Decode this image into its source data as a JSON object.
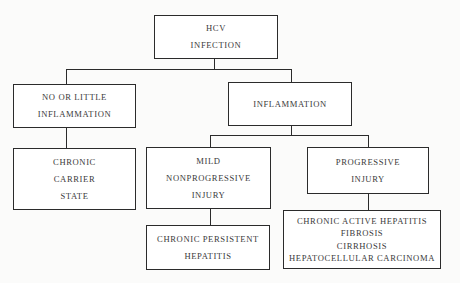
{
  "diagram": {
    "type": "tree",
    "root": {
      "id": "hcv-infection",
      "lines": [
        "HCV",
        "INFECTION"
      ]
    },
    "nodes": {
      "no_little_inflammation": {
        "lines": [
          "NO OR LITTLE",
          "INFLAMMATION"
        ]
      },
      "inflammation": {
        "lines": [
          "INFLAMMATION"
        ]
      },
      "chronic_carrier_state": {
        "lines": [
          "CHRONIC",
          "CARRIER",
          "STATE"
        ]
      },
      "mild_nonprogressive_injury": {
        "lines": [
          "MILD",
          "NONPROGRESSIVE",
          "INJURY"
        ]
      },
      "progressive_injury": {
        "lines": [
          "PROGRESSIVE",
          "INJURY"
        ]
      },
      "chronic_persistent_hepatitis": {
        "lines": [
          "CHRONIC PERSISTENT",
          "HEPATITIS"
        ]
      },
      "progressive_outcomes": {
        "lines": [
          "CHRONIC ACTIVE HEPATITIS",
          "FIBROSIS",
          "CIRRHOSIS",
          "HEPATOCELLULAR CARCINOMA"
        ]
      }
    },
    "edges": [
      [
        "hcv-infection",
        "no_little_inflammation"
      ],
      [
        "hcv-infection",
        "inflammation"
      ],
      [
        "no_little_inflammation",
        "chronic_carrier_state"
      ],
      [
        "inflammation",
        "mild_nonprogressive_injury"
      ],
      [
        "inflammation",
        "progressive_injury"
      ],
      [
        "mild_nonprogressive_injury",
        "chronic_persistent_hepatitis"
      ],
      [
        "progressive_injury",
        "progressive_outcomes"
      ]
    ]
  }
}
